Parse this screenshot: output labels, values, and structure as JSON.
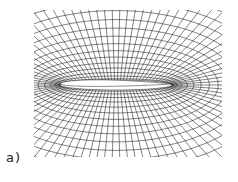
{
  "figure": {
    "label": "a)",
    "colors": {
      "mesh": "#1a1a1a",
      "background": "#ffffff"
    },
    "mesh": {
      "bounds": {
        "x0": 34,
        "y0": 10,
        "x1": 222,
        "y1": 157
      },
      "airfoil": {
        "le_x": 60,
        "te_x": 172,
        "y": 85,
        "thickness": 10
      },
      "rings": 16,
      "spokes": 90
    }
  }
}
